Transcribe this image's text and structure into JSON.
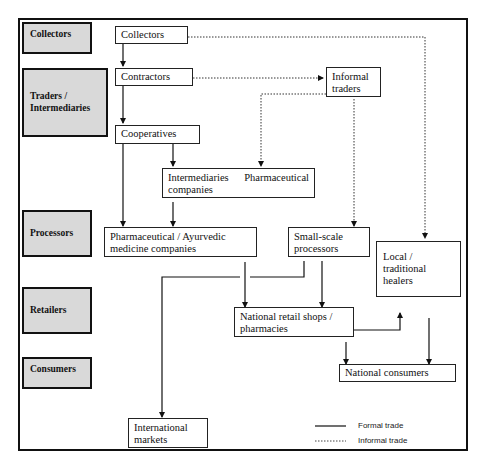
{
  "stages": [
    {
      "id": "collectors",
      "label": "Collectors"
    },
    {
      "id": "traders",
      "label": "Traders / Intermediaries"
    },
    {
      "id": "processors",
      "label": "Processors"
    },
    {
      "id": "retailers",
      "label": "Retailers"
    },
    {
      "id": "consumers",
      "label": "Consumers"
    }
  ],
  "nodes": {
    "collectors": "Collectors",
    "contractors": "Contractors",
    "informal_traders": "Informal traders",
    "cooperatives": "Cooperatives",
    "intermediaries_pharma": "Intermediaries Pharmaceutical companies",
    "intermediaries_word": "Intermediaries",
    "pharmaceutical_word": "Pharmaceutical",
    "companies_word": "companies",
    "pharma_ayurvedic": "Pharmaceutical / Ayurvedic medicine companies",
    "small_scale_processors": "Small-scale processors",
    "local_healers": "Local / traditional healers",
    "national_retail": "National retail shops / pharmacies",
    "national_consumers": "National consumers",
    "international_markets": "International markets"
  },
  "edges": [
    {
      "from": "collectors",
      "to": "contractors",
      "type": "formal"
    },
    {
      "from": "contractors",
      "to": "cooperatives",
      "type": "formal"
    },
    {
      "from": "contractors",
      "to": "informal_traders",
      "type": "informal"
    },
    {
      "from": "collectors",
      "to": "local_healers",
      "type": "informal"
    },
    {
      "from": "informal_traders",
      "to": "intermediaries_pharma",
      "type": "informal"
    },
    {
      "from": "informal_traders",
      "to": "small_scale_processors",
      "type": "informal"
    },
    {
      "from": "cooperatives",
      "to": "intermediaries_pharma",
      "type": "formal"
    },
    {
      "from": "cooperatives",
      "to": "pharma_ayurvedic",
      "type": "formal"
    },
    {
      "from": "intermediaries_pharma",
      "to": "pharma_ayurvedic",
      "type": "formal"
    },
    {
      "from": "pharma_ayurvedic",
      "to": "national_retail",
      "type": "formal"
    },
    {
      "from": "small_scale_processors",
      "to": "national_retail",
      "type": "formal"
    },
    {
      "from": "small_scale_processors",
      "to": "international_markets",
      "type": "formal"
    },
    {
      "from": "national_retail",
      "to": "local_healers",
      "type": "formal"
    },
    {
      "from": "national_retail",
      "to": "national_consumers",
      "type": "formal"
    },
    {
      "from": "local_healers",
      "to": "national_consumers",
      "type": "formal"
    }
  ],
  "legend": {
    "formal": "Formal trade",
    "informal": "Informal trade"
  },
  "colors": {
    "stage_fill": "#d9d9d9",
    "line": "#111111"
  }
}
